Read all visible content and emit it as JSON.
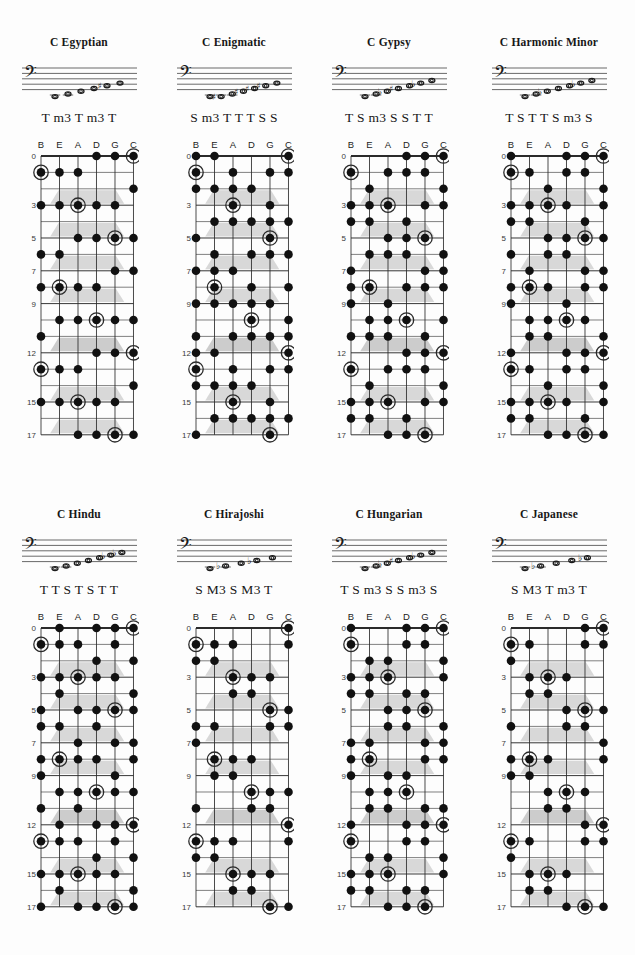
{
  "page": {
    "kind": "scale-reference-sheet",
    "instrument_tuning": [
      "B",
      "E",
      "A",
      "D",
      "G",
      "C"
    ],
    "fret_numbers": [
      0,
      3,
      5,
      7,
      9,
      12,
      15,
      17
    ],
    "fret_min": 0,
    "fret_max": 17,
    "clef": "bass-clef",
    "colors": {
      "ink": "#1a1a1a",
      "grid": "#2b2b2b",
      "dot": "#111111",
      "marker": "#c9c9c9",
      "paper": "#fdfdfd"
    }
  },
  "rows": [
    {
      "cells": [
        {
          "title": "C Egyptian",
          "intervals": "T m3 T m3 T",
          "staff_notes": [
            {
              "step": 0,
              "accidental": ""
            },
            {
              "step": 1,
              "accidental": ""
            },
            {
              "step": 2,
              "accidental": ""
            },
            {
              "step": 3,
              "accidental": ""
            },
            {
              "step": 4,
              "accidental": "sharp"
            },
            {
              "step": 5,
              "accidental": ""
            }
          ],
          "pitch_classes": [
            0,
            2,
            5,
            7,
            10
          ],
          "root_pc": 0
        },
        {
          "title": "C Enigmatic",
          "intervals": "S m3 T T T S S",
          "staff_notes": [
            {
              "step": 0,
              "accidental": ""
            },
            {
              "step": 0,
              "accidental": "sharp"
            },
            {
              "step": 1,
              "accidental": ""
            },
            {
              "step": 2,
              "accidental": "sharp"
            },
            {
              "step": 3,
              "accidental": "sharp"
            },
            {
              "step": 4,
              "accidental": "sharp"
            },
            {
              "step": 5,
              "accidental": ""
            }
          ],
          "pitch_classes": [
            0,
            1,
            4,
            6,
            8,
            10,
            11
          ],
          "root_pc": 0
        },
        {
          "title": "C Gypsy",
          "intervals": "T S m3 S S T T",
          "staff_notes": [
            {
              "step": 0,
              "accidental": ""
            },
            {
              "step": 1,
              "accidental": ""
            },
            {
              "step": 2,
              "accidental": "flat"
            },
            {
              "step": 3,
              "accidental": "sharp"
            },
            {
              "step": 4,
              "accidental": ""
            },
            {
              "step": 5,
              "accidental": "flat"
            },
            {
              "step": 6,
              "accidental": ""
            }
          ],
          "pitch_classes": [
            0,
            2,
            3,
            6,
            7,
            8,
            10
          ],
          "root_pc": 0
        },
        {
          "title": "C Harmonic Minor",
          "intervals": "T S T T S m3 S",
          "staff_notes": [
            {
              "step": 0,
              "accidental": ""
            },
            {
              "step": 1,
              "accidental": ""
            },
            {
              "step": 2,
              "accidental": "flat"
            },
            {
              "step": 3,
              "accidental": ""
            },
            {
              "step": 4,
              "accidental": ""
            },
            {
              "step": 5,
              "accidental": "flat"
            },
            {
              "step": 6,
              "accidental": ""
            }
          ],
          "pitch_classes": [
            0,
            2,
            3,
            5,
            7,
            8,
            11
          ],
          "root_pc": 0
        }
      ]
    },
    {
      "cells": [
        {
          "title": "C Hindu",
          "intervals": "T T S T S T T",
          "staff_notes": [
            {
              "step": 0,
              "accidental": ""
            },
            {
              "step": 1,
              "accidental": ""
            },
            {
              "step": 2,
              "accidental": ""
            },
            {
              "step": 3,
              "accidental": ""
            },
            {
              "step": 4,
              "accidental": ""
            },
            {
              "step": 5,
              "accidental": "flat"
            },
            {
              "step": 6,
              "accidental": "flat"
            }
          ],
          "pitch_classes": [
            0,
            2,
            4,
            5,
            7,
            8,
            10
          ],
          "root_pc": 0
        },
        {
          "title": "C Hirajoshi",
          "intervals": "S M3 S M3 T",
          "staff_notes": [
            {
              "step": 0,
              "accidental": ""
            },
            {
              "step": 1,
              "accidental": "flat"
            },
            {
              "step": 2,
              "accidental": ""
            },
            {
              "step": 3,
              "accidental": "flat"
            },
            {
              "step": 4,
              "accidental": ""
            }
          ],
          "pitch_classes": [
            0,
            1,
            5,
            6,
            10
          ],
          "root_pc": 0
        },
        {
          "title": "C Hungarian",
          "intervals": "T S m3 S S m3 S",
          "staff_notes": [
            {
              "step": 0,
              "accidental": ""
            },
            {
              "step": 1,
              "accidental": ""
            },
            {
              "step": 2,
              "accidental": "flat"
            },
            {
              "step": 3,
              "accidental": "sharp"
            },
            {
              "step": 4,
              "accidental": ""
            },
            {
              "step": 5,
              "accidental": "flat"
            },
            {
              "step": 6,
              "accidental": ""
            }
          ],
          "pitch_classes": [
            0,
            2,
            3,
            6,
            7,
            8,
            11
          ],
          "root_pc": 0
        },
        {
          "title": "C Japanese",
          "intervals": "S M3 T m3 T",
          "staff_notes": [
            {
              "step": 0,
              "accidental": ""
            },
            {
              "step": 1,
              "accidental": "flat"
            },
            {
              "step": 2,
              "accidental": ""
            },
            {
              "step": 3,
              "accidental": ""
            },
            {
              "step": 4,
              "accidental": "flat"
            }
          ],
          "pitch_classes": [
            0,
            1,
            5,
            7,
            8
          ],
          "root_pc": 0
        }
      ]
    }
  ]
}
